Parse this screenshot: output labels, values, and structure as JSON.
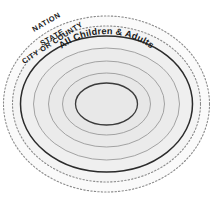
{
  "diagram": {
    "type": "concentric-ellipse-target",
    "background_color": "#ffffff",
    "center": {
      "cx": 106.5,
      "cy": 104
    },
    "rings": [
      {
        "id": "nation",
        "label": "NATION",
        "order": 1,
        "rx": 103,
        "ry": 88,
        "stroke_style": "dotted",
        "stroke_color": "#8a8a8a",
        "stroke_width": 1.1,
        "fill_color": "#fafafa",
        "label_x": 34,
        "label_y": 32,
        "label_rotation": -30,
        "label_size": 7.4,
        "label_spacing": 0.6
      },
      {
        "id": "state",
        "label": "STATE",
        "order": 2,
        "rx": 94,
        "ry": 78,
        "stroke_style": "dotted",
        "stroke_color": "#8a8a8a",
        "stroke_width": 1.1,
        "fill_color": "#f4f4f4",
        "label_x": 42,
        "label_y": 46,
        "label_rotation": -30,
        "label_size": 7.4,
        "label_spacing": 0.6
      },
      {
        "id": "city-or-county",
        "label": "CITY OR COUNTY",
        "order": 3,
        "rx": 86,
        "ry": 68,
        "stroke_style": "solid",
        "stroke_color": "#2b2b2b",
        "stroke_width": 1.5,
        "fill_color": "#efefef",
        "label_x": 24,
        "label_y": 64,
        "label_rotation": -33,
        "label_size": 7.4,
        "label_spacing": 0.55
      },
      {
        "id": "all-children-and-adults",
        "label": "All Children & Adults",
        "order": 4,
        "rx": 73,
        "ry": 56,
        "stroke_style": "solid",
        "stroke_color": "#9a9a9a",
        "stroke_width": 0.9,
        "fill_color": "#ebebeb",
        "label_size": 9.2,
        "label_spacing": 0.2,
        "label_on_curve": true,
        "label_curve_offset": 14
      },
      {
        "id": "ring-inner-1",
        "label": "",
        "order": 5,
        "rx": 58,
        "ry": 43,
        "stroke_style": "solid",
        "stroke_color": "#9a9a9a",
        "stroke_width": 0.9,
        "fill_color": "#e9e9e9"
      },
      {
        "id": "ring-inner-2",
        "label": "",
        "order": 6,
        "rx": 44,
        "ry": 31,
        "stroke_style": "solid",
        "stroke_color": "#9a9a9a",
        "stroke_width": 0.9,
        "fill_color": "#e7e7e7"
      },
      {
        "id": "core",
        "label": "",
        "order": 7,
        "rx": 31,
        "ry": 21,
        "stroke_style": "solid",
        "stroke_color": "#3a3a3a",
        "stroke_width": 1.3,
        "fill_color": "#e8e8e8"
      }
    ]
  }
}
